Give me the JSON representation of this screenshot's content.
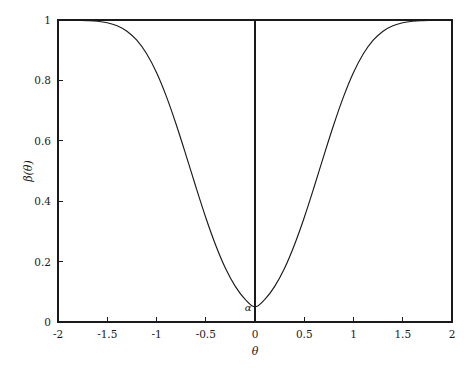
{
  "chart_data": {
    "type": "line",
    "title": "",
    "subtitle": "",
    "xlabel": "θ",
    "ylabel": "β(θ)",
    "xlim": [
      -2,
      2
    ],
    "ylim": [
      0,
      1
    ],
    "grid": false,
    "legend": "none",
    "xticks": [
      -2,
      -1.5,
      -1,
      -0.5,
      0,
      0.5,
      1,
      1.5,
      2
    ],
    "xticklabels": [
      "-2",
      "-1.5",
      "-1",
      "-0.5",
      "0",
      "0.5",
      "1",
      "1.5",
      "2"
    ],
    "yticks": [
      0,
      0.2,
      0.4,
      0.6,
      0.8,
      1
    ],
    "yticklabels": [
      "0",
      "0.2",
      "0.4",
      "0.6",
      "0.8",
      "1"
    ],
    "annotations": [
      {
        "text": "α",
        "x": -0.07,
        "y": 0.035,
        "description": "significance level at the minimum of the power function"
      }
    ],
    "reference_lines": [
      {
        "orientation": "vertical",
        "x": 0,
        "from_y": 0,
        "to_y": 1
      }
    ],
    "series": [
      {
        "name": "β(θ)",
        "color": "#1a1a1a",
        "x": [
          -2,
          -1.9,
          -1.8,
          -1.7,
          -1.6,
          -1.5,
          -1.4,
          -1.3,
          -1.2,
          -1.1,
          -1,
          -0.9,
          -0.8,
          -0.7,
          -0.6,
          -0.5,
          -0.4,
          -0.3,
          -0.2,
          -0.1,
          0,
          0.1,
          0.2,
          0.3,
          0.4,
          0.5,
          0.6,
          0.7,
          0.8,
          0.9,
          1,
          1.1,
          1.2,
          1.3,
          1.4,
          1.5,
          1.6,
          1.7,
          1.8,
          1.9,
          2
        ],
        "y": [
          1,
          1,
          0.999,
          0.998,
          0.996,
          0.991,
          0.981,
          0.963,
          0.933,
          0.888,
          0.826,
          0.747,
          0.654,
          0.552,
          0.447,
          0.346,
          0.255,
          0.178,
          0.118,
          0.075,
          0.05,
          0.075,
          0.118,
          0.178,
          0.255,
          0.346,
          0.447,
          0.552,
          0.654,
          0.747,
          0.826,
          0.888,
          0.933,
          0.963,
          0.981,
          0.991,
          0.996,
          0.998,
          0.999,
          1,
          1
        ]
      }
    ]
  },
  "axes": {
    "x_title": "θ",
    "y_title": "β(θ)"
  },
  "annotation": {
    "alpha": "α"
  }
}
